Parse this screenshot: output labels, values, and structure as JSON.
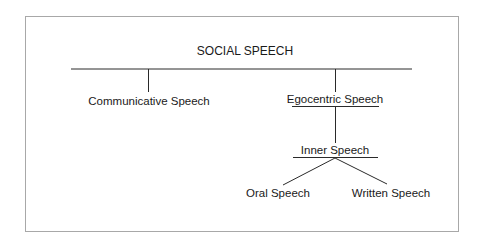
{
  "diagram": {
    "type": "tree",
    "root": {
      "label": "SOCIAL SPEECH",
      "children": [
        {
          "label": "Communicative Speech",
          "children": []
        },
        {
          "label": "Egocentric Speech",
          "underlined": true,
          "children": [
            {
              "label": "Inner Speech",
              "underlined": true,
              "children": [
                {
                  "label": "Oral Speech",
                  "children": []
                },
                {
                  "label": "Written Speech",
                  "children": []
                }
              ]
            }
          ]
        }
      ]
    }
  },
  "nodes": {
    "root": "SOCIAL SPEECH",
    "communicative": "Communicative Speech",
    "egocentric": "Egocentric Speech",
    "inner": "Inner Speech",
    "oral": "Oral Speech",
    "written": "Written Speech"
  },
  "colors": {
    "line": "#2a2a2a",
    "frame": "#a8a8a8",
    "text": "#1a1a1a"
  }
}
